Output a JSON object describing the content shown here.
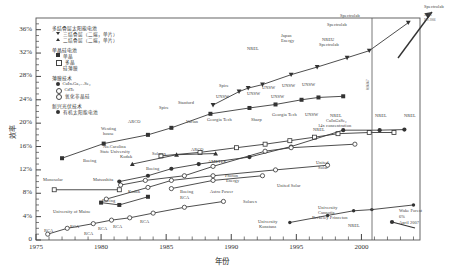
{
  "chart_data": {
    "type": "line",
    "title": "",
    "xlabel": "年份",
    "ylabel": "效率",
    "xlim": [
      1975,
      2004.5
    ],
    "ylim": [
      0,
      38
    ],
    "xticks": [
      "1975",
      "1980",
      "1985",
      "1990",
      "1995",
      "2000"
    ],
    "yticks": [
      "0",
      "4%",
      "8%",
      "12%",
      "16%",
      "20%",
      "24%",
      "28%",
      "32%",
      "36%"
    ],
    "grid": false,
    "legend_position": "top-left-inside",
    "series": [
      {
        "name": "多结叠层太阳能电池 (三结叠层)",
        "marker": "triangle-down-filled",
        "points": [
          {
            "x": 1988.6,
            "y": 23.1,
            "label": "NREL"
          },
          {
            "x": 1990.6,
            "y": 25.4,
            "label": ""
          },
          {
            "x": 1991.3,
            "y": 26.0,
            "label": "Japan Energy"
          },
          {
            "x": 1992.4,
            "y": 26.6,
            "label": ""
          },
          {
            "x": 1994.6,
            "y": 28.3,
            "label": "NREU Spectrolab"
          },
          {
            "x": 1996.6,
            "y": 29.6,
            "label": ""
          },
          {
            "x": 1998.9,
            "y": 31.2,
            "label": "Spectrolab"
          },
          {
            "x": 2000.6,
            "y": 32.4,
            "label": "Spectrolab"
          },
          {
            "x": 2003.6,
            "y": 37.2,
            "label": "Spectrolab"
          }
        ]
      },
      {
        "name": "单晶硅电池 单晶",
        "marker": "square-filled",
        "points": [
          {
            "x": 1977.0,
            "y": 14.0,
            "label": "Westinghouse"
          },
          {
            "x": 1980.2,
            "y": 16.5,
            "label": "ARCO"
          },
          {
            "x": 1983.6,
            "y": 18.0,
            "label": "Spire"
          },
          {
            "x": 1985.4,
            "y": 19.2,
            "label": "Stanford"
          },
          {
            "x": 1988.4,
            "y": 21.6,
            "label": "Spire"
          },
          {
            "x": 1991.4,
            "y": 22.6,
            "label": "UNSW"
          },
          {
            "x": 1993.4,
            "y": 23.2,
            "label": "UNSW"
          },
          {
            "x": 1995.4,
            "y": 24.0,
            "label": "UNSW"
          },
          {
            "x": 1996.7,
            "y": 24.4,
            "label": "UNSW"
          },
          {
            "x": 1998.6,
            "y": 24.6,
            "label": "UNSW"
          }
        ]
      },
      {
        "name": "单晶硅电池 多晶",
        "marker": "square-open",
        "points": [
          {
            "x": 1984.6,
            "y": 14.4,
            "label": "Varian"
          },
          {
            "x": 1987.6,
            "y": 15.0,
            "label": ""
          },
          {
            "x": 1990.4,
            "y": 15.8,
            "label": "Georgia Tech"
          },
          {
            "x": 1992.6,
            "y": 16.4,
            "label": "Sharp"
          },
          {
            "x": 1994.5,
            "y": 17.0,
            "label": "Georgia Tech"
          },
          {
            "x": 1996.4,
            "y": 17.6,
            "label": "UNSW"
          },
          {
            "x": 1998.2,
            "y": 18.2,
            "label": "NREL"
          },
          {
            "x": 2000.6,
            "y": 18.4,
            "label": "NREL"
          },
          {
            "x": 2002.5,
            "y": 18.4,
            "label": "NREL"
          }
        ]
      },
      {
        "name": "薄膜技术 CuInGaSe2",
        "marker": "circle-filled",
        "points": [
          {
            "x": 1981.4,
            "y": 10.0,
            "label": "Kodak"
          },
          {
            "x": 1983.6,
            "y": 11.0,
            "label": "Boeing"
          },
          {
            "x": 1985.4,
            "y": 12.2,
            "label": "Boeing"
          },
          {
            "x": 1987.5,
            "y": 13.0,
            "label": "ARCO"
          },
          {
            "x": 1991.4,
            "y": 14.2,
            "label": "NREL"
          },
          {
            "x": 1994.6,
            "y": 16.0,
            "label": "NREL"
          },
          {
            "x": 1998.6,
            "y": 18.8,
            "label": "NREL CuInGaSe2 14x concentration"
          },
          {
            "x": 2001.4,
            "y": 18.8,
            "label": "NREL"
          },
          {
            "x": 2003.3,
            "y": 18.9,
            "label": "NREL"
          }
        ]
      },
      {
        "name": "薄膜技术 CdTe",
        "marker": "circle-open",
        "points": [
          {
            "x": 1981.5,
            "y": 9.4,
            "label": "Kodak"
          },
          {
            "x": 1983.4,
            "y": 10.2,
            "label": "Monosolar"
          },
          {
            "x": 1986.4,
            "y": 11.0,
            "label": "AMETEK"
          },
          {
            "x": 1988.6,
            "y": 12.6,
            "label": ""
          },
          {
            "x": 1992.6,
            "y": 15.2,
            "label": ""
          },
          {
            "x": 1994.6,
            "y": 15.8,
            "label": "Matsushita"
          },
          {
            "x": 1999.5,
            "y": 16.4,
            "label": "NREL"
          }
        ]
      },
      {
        "name": "薄膜技术 氧化非晶硅",
        "marker": "circle-open",
        "points": [
          {
            "x": 1980.4,
            "y": 7.0,
            "label": "RCA"
          },
          {
            "x": 1983.6,
            "y": 9.0,
            "label": "Boeing"
          },
          {
            "x": 1985.4,
            "y": 10.2,
            "label": "Solarex"
          },
          {
            "x": 1988.6,
            "y": 11.0,
            "label": "Photon Energy"
          },
          {
            "x": 1993.4,
            "y": 12.0,
            "label": "United Solar"
          },
          {
            "x": 1997.4,
            "y": 12.8,
            "label": "United Solar"
          }
        ]
      },
      {
        "name": "新兴光伏技术 有机太阳能电池",
        "marker": "circle-filled-small",
        "points": [
          {
            "x": 1994.5,
            "y": 3.0,
            "label": "University Konstanz"
          },
          {
            "x": 1997.4,
            "y": 4.2,
            "label": ""
          },
          {
            "x": 1999.4,
            "y": 5.0,
            "label": "University Cannotia Berkeley Princeton"
          },
          {
            "x": 2000.8,
            "y": 5.2,
            "label": "NREL"
          },
          {
            "x": 2004.0,
            "y": 6.0,
            "label": "Wake Forest 6% April 2007"
          }
        ]
      },
      {
        "name": "RCA 非晶硅早期",
        "marker": "circle-open",
        "points": [
          {
            "x": 1975.9,
            "y": 1.0,
            "label": "RCA"
          },
          {
            "x": 1977.4,
            "y": 2.0,
            "label": "RCA"
          },
          {
            "x": 1979.4,
            "y": 2.8,
            "label": "RCA"
          },
          {
            "x": 1980.8,
            "y": 3.4,
            "label": "RCA"
          },
          {
            "x": 1982.2,
            "y": 3.8,
            "label": "RCA"
          },
          {
            "x": 1984.0,
            "y": 4.6,
            "label": "RCA"
          },
          {
            "x": 1986.4,
            "y": 5.6,
            "label": "RCA"
          },
          {
            "x": 1989.4,
            "y": 6.6,
            "label": "Solarex"
          }
        ]
      },
      {
        "name": "University of Maine 早期薄膜",
        "marker": "square-filled",
        "points": [
          {
            "x": 1980.0,
            "y": 6.4,
            "label": "University of Maine"
          },
          {
            "x": 1981.4,
            "y": 6.0,
            "label": ""
          },
          {
            "x": 1983.6,
            "y": 7.4,
            "label": "Boeing"
          }
        ]
      },
      {
        "name": "Matsushita 早期",
        "marker": "square-open",
        "points": [
          {
            "x": 1976.4,
            "y": 8.6,
            "label": "Monosolar"
          },
          {
            "x": 1981.4,
            "y": 8.6,
            "label": "Matsushita"
          }
        ]
      },
      {
        "name": "No.Carolina State University",
        "marker": "triangle-up-filled",
        "points": [
          {
            "x": 1982.4,
            "y": 13.0,
            "label": "No.Carolina State University"
          },
          {
            "x": 1985.8,
            "y": 14.6,
            "label": "Solarex"
          },
          {
            "x": 1988.8,
            "y": 14.8,
            "label": ""
          }
        ]
      },
      {
        "name": "Astro Power",
        "marker": "circle-open",
        "points": [
          {
            "x": 1985.4,
            "y": 8.8,
            "label": "Astro Power"
          },
          {
            "x": 1988.6,
            "y": 10.2,
            "label": ""
          },
          {
            "x": 1992.4,
            "y": 11.0,
            "label": ""
          }
        ]
      }
    ]
  },
  "axis": {
    "y_label": "效率",
    "x_label": "年份",
    "y_ticks": [
      "36%",
      "32%",
      "28%",
      "24%",
      "20%",
      "16%",
      "12%",
      "8%",
      "4%",
      "0"
    ],
    "x_ticks": [
      "1975",
      "1980",
      "1985",
      "1990",
      "1995",
      "2000"
    ]
  },
  "legend": {
    "groups": [
      {
        "heading": "多结叠层太阳能电池",
        "items": [
          {
            "marker": "tri-d",
            "label": "三结叠层（二端，单片）"
          },
          {
            "marker": "tri-u",
            "label": "二结叠层（二端，单片）"
          }
        ]
      },
      {
        "heading": "单晶硅电池",
        "items": [
          {
            "marker": "sq-f",
            "label": "单晶"
          },
          {
            "marker": "sq-o",
            "label": "多晶"
          },
          {
            "marker": "none",
            "label": "硅薄膜"
          }
        ]
      },
      {
        "heading": "薄膜技术",
        "items": [
          {
            "marker": "ci-f",
            "label": "CuInₓGa₁₋ₓSe₂"
          },
          {
            "marker": "ci-o",
            "label": "CdTe"
          },
          {
            "marker": "ci-o",
            "label": "氧化非晶硅"
          }
        ]
      },
      {
        "heading": "新兴光伏技术",
        "items": [
          {
            "marker": "ci-f",
            "label": "有机太阳能电池"
          }
        ]
      }
    ]
  },
  "annotations": {
    "vertical_right": "0286867",
    "spectrolab_note_line1": "36.9%",
    "spectrolab_note_line2": "Dec 2006",
    "wake_forest_line1": "Wake Forest",
    "wake_forest_line2": "6%",
    "wake_forest_line3": "April 2007"
  },
  "point_labels": [
    {
      "id": "nrel-1",
      "text": "NREL",
      "x": 247,
      "y": 47
    },
    {
      "id": "japan-energy",
      "text": "Japan",
      "x": 281,
      "y": 34
    },
    {
      "id": "japan-energy2",
      "text": "Energy",
      "x": 281,
      "y": 39
    },
    {
      "id": "nreu",
      "text": "NREU",
      "x": 322,
      "y": 38
    },
    {
      "id": "spectrolab-1",
      "text": "Spectrolab",
      "x": 319,
      "y": 43
    },
    {
      "id": "spectrolab-2",
      "text": "Spectrolab",
      "x": 327,
      "y": 23
    },
    {
      "id": "spectrolab-3",
      "text": "Spectrolab",
      "x": 340,
      "y": 14
    },
    {
      "id": "spectrolab-4",
      "text": "Spectrolab",
      "x": 424,
      "y": 5
    },
    {
      "id": "westinghouse1",
      "text": "Westing",
      "x": 101,
      "y": 127
    },
    {
      "id": "westinghouse2",
      "text": "house",
      "x": 103,
      "y": 132
    },
    {
      "id": "arco-1",
      "text": "ARCO",
      "x": 128,
      "y": 120
    },
    {
      "id": "spire-1",
      "text": "Spire",
      "x": 159,
      "y": 106
    },
    {
      "id": "stanford",
      "text": "Stanford",
      "x": 178,
      "y": 101
    },
    {
      "id": "spire-2",
      "text": "Spire",
      "x": 219,
      "y": 84
    },
    {
      "id": "unsw-1",
      "text": "UNSW",
      "x": 216,
      "y": 95
    },
    {
      "id": "unsw-2",
      "text": "UNSW",
      "x": 247,
      "y": 92
    },
    {
      "id": "unsw-3",
      "text": "UNSW",
      "x": 262,
      "y": 86
    },
    {
      "id": "unsw-4",
      "text": "UNSW",
      "x": 282,
      "y": 84
    },
    {
      "id": "unsw-5",
      "text": "UNSW",
      "x": 302,
      "y": 83
    },
    {
      "id": "unsw-6",
      "text": "UNSW",
      "x": 271,
      "y": 95
    },
    {
      "id": "varian",
      "text": "Varian",
      "x": 186,
      "y": 120
    },
    {
      "id": "georgia-1",
      "text": "Georgia Tech",
      "x": 207,
      "y": 118
    },
    {
      "id": "sharp",
      "text": "Sharp",
      "x": 251,
      "y": 118
    },
    {
      "id": "georgia-2",
      "text": "Georgia Tech",
      "x": 272,
      "y": 113
    },
    {
      "id": "unsw-7",
      "text": "UNSW",
      "x": 305,
      "y": 113
    },
    {
      "id": "nrel-cigs1",
      "text": "NREL",
      "x": 330,
      "y": 114
    },
    {
      "id": "nrel-cigs2",
      "text": "CuInGaSe₂",
      "x": 326,
      "y": 119
    },
    {
      "id": "nrel-cigs3",
      "text": "14x concentration",
      "x": 318,
      "y": 124
    },
    {
      "id": "nrel-2",
      "text": "NREL",
      "x": 375,
      "y": 114
    },
    {
      "id": "nrel-3",
      "text": "NREL",
      "x": 404,
      "y": 114
    },
    {
      "id": "nrel-4",
      "text": "NREL",
      "x": 313,
      "y": 128
    },
    {
      "id": "ncsu-1",
      "text": "No.Carolina",
      "x": 103,
      "y": 145
    },
    {
      "id": "ncsu-2",
      "text": "State University",
      "x": 100,
      "y": 150
    },
    {
      "id": "solarex-1",
      "text": "Solarex",
      "x": 152,
      "y": 152
    },
    {
      "id": "arco-2",
      "text": "ARCO",
      "x": 191,
      "y": 148
    },
    {
      "id": "boeing-1",
      "text": "Boeing",
      "x": 83,
      "y": 159
    },
    {
      "id": "kodak-1",
      "text": "Kodak",
      "x": 120,
      "y": 155
    },
    {
      "id": "ametek",
      "text": "AMETEK",
      "x": 208,
      "y": 160
    },
    {
      "id": "boeing-2",
      "text": "Boeing",
      "x": 146,
      "y": 167
    },
    {
      "id": "photon-1",
      "text": "Photon",
      "x": 225,
      "y": 174
    },
    {
      "id": "photon-2",
      "text": "Energy",
      "x": 226,
      "y": 179
    },
    {
      "id": "united-1",
      "text": "United",
      "x": 316,
      "y": 161
    },
    {
      "id": "united-2",
      "text": "Solar",
      "x": 318,
      "y": 166
    },
    {
      "id": "united-3",
      "text": "United Solar",
      "x": 277,
      "y": 184
    },
    {
      "id": "matsu-1",
      "text": "Monosolar",
      "x": 43,
      "y": 178
    },
    {
      "id": "matsu-2",
      "text": "Matsushita",
      "x": 93,
      "y": 178
    },
    {
      "id": "kodak-2",
      "text": "Kodak",
      "x": 128,
      "y": 190
    },
    {
      "id": "boeing-3",
      "text": "Boeing",
      "x": 180,
      "y": 190
    },
    {
      "id": "astro",
      "text": "Astro Power",
      "x": 210,
      "y": 190
    },
    {
      "id": "boeing-4",
      "text": "Boeing",
      "x": 102,
      "y": 199
    },
    {
      "id": "rca-main",
      "text": "RCA",
      "x": 180,
      "y": 196
    },
    {
      "id": "solarex-2",
      "text": "Solarex",
      "x": 243,
      "y": 200
    },
    {
      "id": "uofmaine",
      "text": "University of Maine",
      "x": 53,
      "y": 210
    },
    {
      "id": "rca-1",
      "text": "RCA",
      "x": 44,
      "y": 229
    },
    {
      "id": "rca-2",
      "text": "RCA",
      "x": 70,
      "y": 225
    },
    {
      "id": "rca-3",
      "text": "RCA",
      "x": 84,
      "y": 232
    },
    {
      "id": "rca-4",
      "text": "RCA",
      "x": 98,
      "y": 227
    },
    {
      "id": "rca-5",
      "text": "RCA",
      "x": 113,
      "y": 225
    },
    {
      "id": "rca-6",
      "text": "RCA",
      "x": 140,
      "y": 220
    },
    {
      "id": "ukonstanz-1",
      "text": "University",
      "x": 258,
      "y": 220
    },
    {
      "id": "ukonstanz-2",
      "text": "Konstanz",
      "x": 259,
      "y": 225
    },
    {
      "id": "ucal-1",
      "text": "University",
      "x": 318,
      "y": 206
    },
    {
      "id": "ucal-2",
      "text": "Cannotia",
      "x": 318,
      "y": 211
    },
    {
      "id": "ucal-3",
      "text": "Berkeley Princeton",
      "x": 312,
      "y": 216
    },
    {
      "id": "nrel-org",
      "text": "NREL",
      "x": 348,
      "y": 224
    }
  ]
}
